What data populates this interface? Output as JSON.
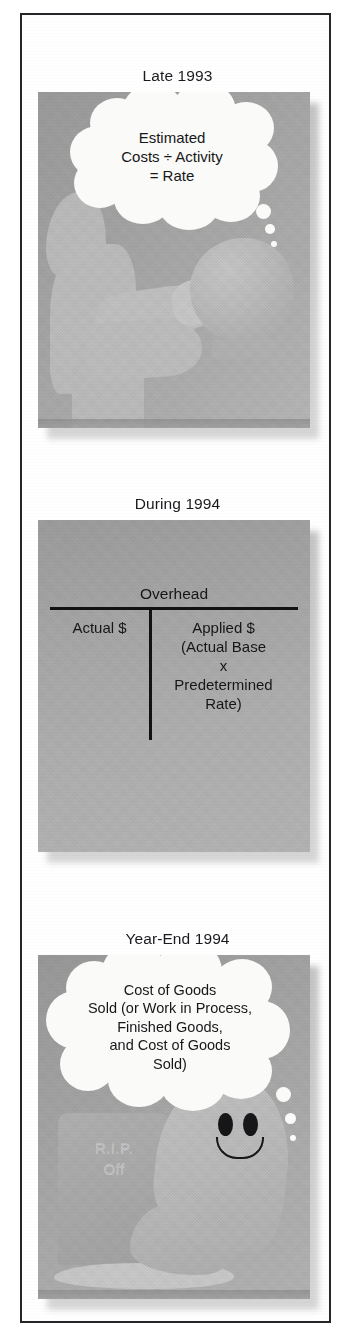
{
  "figure": {
    "panels": [
      {
        "id": "late-1993",
        "label": "Late 1993",
        "bubble_text": "Estimated\nCosts ÷ Activity\n= Rate",
        "scene": "fortune-teller-with-crystal-ball"
      },
      {
        "id": "during-1994",
        "label": "During 1994",
        "scene": "overhead-t-account",
        "t_account": {
          "title": "Overhead",
          "left_label": "Actual $",
          "right_label": "Applied $\n(Actual Base\nx\nPredetermined\nRate)"
        }
      },
      {
        "id": "year-end-1994",
        "label": "Year-End 1994",
        "bubble_text": "Cost of Goods\nSold (or Work in Process,\nFinished Goods,\nand Cost of Goods\nSold)",
        "scene": "ghost-and-tombstone",
        "tombstone_text": "R.I.P.\nOff"
      }
    ],
    "colors": {
      "frame_border": "#26262a",
      "artwork_grey": "#a9a9a9",
      "bubble_fill": "#fafaf8",
      "ink": "#17171a",
      "tombstone_grey": "#aaaaaa"
    }
  }
}
